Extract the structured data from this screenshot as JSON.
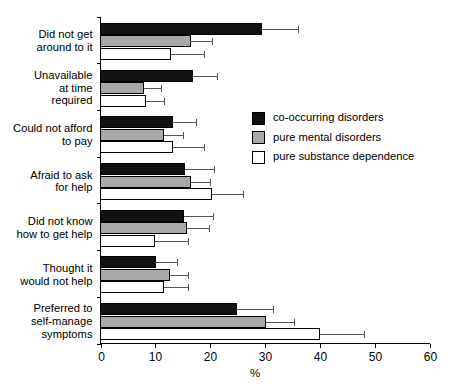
{
  "chart_data": {
    "type": "bar",
    "orientation": "horizontal",
    "title": "",
    "xlabel": "%",
    "ylabel": "",
    "xlim": [
      0,
      60
    ],
    "xticks": [
      0,
      10,
      20,
      30,
      40,
      50,
      60
    ],
    "xtick_labels": [
      "0",
      "10",
      "20",
      "30",
      "40",
      "50",
      "60"
    ],
    "grid": false,
    "legend_position": "center-right",
    "error_bars": "upper only",
    "categories": [
      "Did not get around to it",
      "Unavailable at time required",
      "Could not afford to pay",
      "Afraid to ask for help",
      "Did not know how to get help",
      "Thought it would not help",
      "Preferred to self-manage symptoms"
    ],
    "category_lines": [
      [
        "Did not get",
        "around to it"
      ],
      [
        "Unavailable",
        "at time",
        "required"
      ],
      [
        "Could not afford",
        "to pay"
      ],
      [
        "Afraid to ask",
        "for help"
      ],
      [
        "Did not know",
        "how to get help"
      ],
      [
        "Thought it",
        "would not help"
      ],
      [
        "Preferred to",
        "self-manage",
        "symptoms"
      ]
    ],
    "series": [
      {
        "name": "co-occurring disorders",
        "color": "#111111",
        "values": [
          29.4,
          16.8,
          13.1,
          15.4,
          15.2,
          10.0,
          24.8
        ],
        "errors_upper": [
          36.0,
          21.3,
          17.5,
          20.7,
          20.6,
          14.0,
          31.4
        ]
      },
      {
        "name": "pure mental disorders",
        "color": "#a8a8a8",
        "values": [
          16.4,
          7.9,
          11.5,
          16.4,
          15.7,
          12.6,
          30.1
        ],
        "errors_upper": [
          20.3,
          11.0,
          15.0,
          20.0,
          19.8,
          15.9,
          35.2
        ]
      },
      {
        "name": "pure substance dependence",
        "color": "#ffffff",
        "values": [
          12.8,
          8.2,
          13.1,
          20.3,
          9.8,
          11.5,
          40.0
        ],
        "errors_upper": [
          18.8,
          11.5,
          18.8,
          26.0,
          15.9,
          16.0,
          48.0
        ]
      }
    ]
  },
  "legend": {
    "items": [
      {
        "label": "co-occurring disorders",
        "color": "#111111"
      },
      {
        "label": "pure mental disorders",
        "color": "#a8a8a8"
      },
      {
        "label": "pure substance dependence",
        "color": "#ffffff"
      }
    ]
  }
}
